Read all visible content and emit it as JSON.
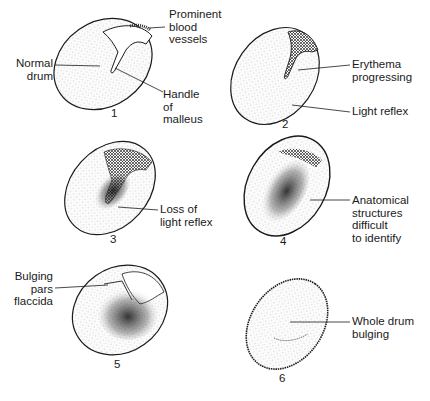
{
  "figure": {
    "panels": [
      {
        "number": "1",
        "labels": [
          "Normal\ndrum",
          "Prominent\nblood\nvessels",
          "Handle\nof\nmalleus"
        ]
      },
      {
        "number": "2",
        "labels": [
          "Erythema\nprogressing",
          "Light reflex"
        ]
      },
      {
        "number": "3",
        "labels": [
          "Loss of\nlight reflex"
        ]
      },
      {
        "number": "4",
        "labels": [
          "Anatomical\nstructures\ndifficult\nto identify"
        ]
      },
      {
        "number": "5",
        "labels": [
          "Bulging\npars\nflaccida"
        ]
      },
      {
        "number": "6",
        "labels": [
          "Whole drum\nbulging"
        ]
      }
    ],
    "colors": {
      "ink": "#1a1a1a",
      "background": "#ffffff"
    }
  }
}
